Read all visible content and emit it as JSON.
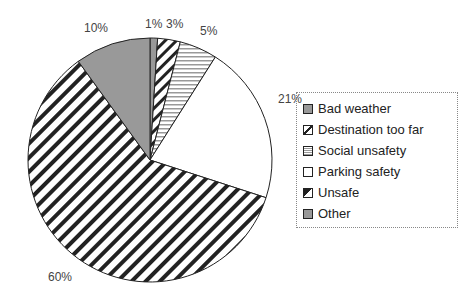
{
  "chart_data": {
    "type": "pie",
    "title": "",
    "categories": [
      "Bad weather",
      "Destination too far",
      "Social unsafety",
      "Parking safety",
      "Unsafe",
      "Other"
    ],
    "values": [
      1,
      3,
      5,
      21,
      60,
      10
    ],
    "labels": [
      "1%",
      "3%",
      "5%",
      "21%",
      "60%",
      "10%"
    ],
    "legend_position": "right"
  },
  "legend": [
    "Bad weather",
    "Destination too far",
    "Social unsafety",
    "Parking safety",
    "Unsafe",
    "Other"
  ]
}
